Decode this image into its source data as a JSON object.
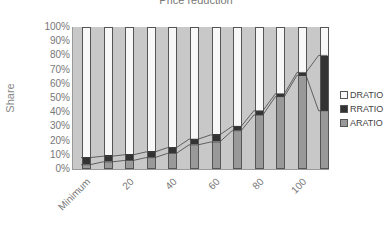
{
  "chart_data": {
    "type": "bar",
    "stacked": true,
    "title": "Price reduction",
    "xlabel": "",
    "ylabel": "Share",
    "ylim": [
      0,
      100
    ],
    "yticks": [
      "100%",
      "90%",
      "80%",
      "70%",
      "60%",
      "50%",
      "40%",
      "30%",
      "20%",
      "10%",
      "0%"
    ],
    "categories": [
      "Minimum",
      "10",
      "20",
      "30",
      "40",
      "50",
      "60",
      "70",
      "80",
      "90",
      "100",
      "110"
    ],
    "xtick_labels": [
      "Minimum",
      "20",
      "40",
      "60",
      "80",
      "100"
    ],
    "series": [
      {
        "name": "ARATIO",
        "color": "#999999",
        "values": [
          3,
          5,
          6,
          8,
          11,
          17,
          19,
          27,
          38,
          51,
          66,
          41
        ]
      },
      {
        "name": "RRATIO",
        "color": "#333333",
        "values": [
          5,
          4,
          4,
          4,
          4,
          4,
          5,
          3,
          3,
          2,
          2,
          39
        ]
      },
      {
        "name": "DRATIO",
        "color": "#f8f8f8",
        "values": [
          92,
          91,
          90,
          88,
          85,
          79,
          76,
          70,
          59,
          47,
          32,
          20
        ]
      }
    ],
    "legend": {
      "position": "right",
      "entries": [
        "DRATIO",
        "RRATIO",
        "ARATIO"
      ]
    },
    "grid": false
  }
}
